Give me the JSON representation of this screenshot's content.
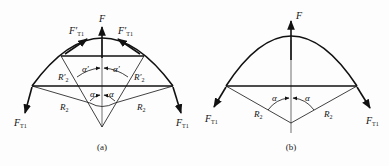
{
  "figure": {
    "panels": [
      {
        "id": "a",
        "caption": "(a)",
        "labels": {
          "force": "F",
          "tension_left_upper": "F′",
          "tension_right_upper": "F′",
          "tension_sub_upper": "T1",
          "tension_left_lower": "F",
          "tension_right_lower": "F",
          "tension_sub_lower": "T1",
          "radius_outer_left": "R",
          "radius_outer_right": "R",
          "radius_outer_sub": "2",
          "radius_inner_left": "R′",
          "radius_inner_right": "R′",
          "radius_inner_sub": "2",
          "angle_inner_left": "α′",
          "angle_inner_right": "α′",
          "angle_outer_left": "α",
          "angle_outer_right": "α"
        }
      },
      {
        "id": "b",
        "caption": "(b)",
        "labels": {
          "force": "F",
          "tension_left": "F",
          "tension_right": "F",
          "tension_sub": "T1",
          "radius_left": "R",
          "radius_right": "R",
          "radius_sub": "2",
          "angle_left": "α",
          "angle_right": "α"
        }
      }
    ],
    "colors": {
      "stroke": "#111111",
      "background": "#fdfdfd"
    }
  }
}
